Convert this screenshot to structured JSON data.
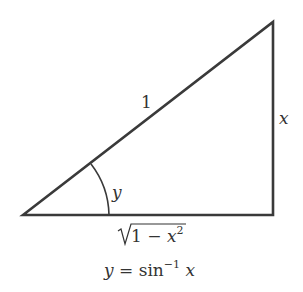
{
  "diagram": {
    "type": "right-triangle",
    "labels": {
      "hypotenuse": "1",
      "opposite": "x",
      "angle": "y",
      "adjacent_radicand_prefix": "1 − ",
      "adjacent_var": "x",
      "adjacent_exp": "2",
      "caption_lhs": "y",
      "caption_eq": " = sin",
      "caption_exp": "−1",
      "caption_var": " x"
    },
    "colors": {
      "stroke": "#3a3a3a",
      "text": "#333333"
    }
  }
}
